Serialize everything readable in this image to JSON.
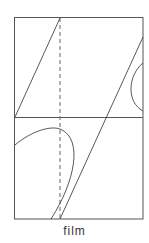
{
  "diagram": {
    "caption": "film",
    "colors": {
      "line": "#444444",
      "background": "#ffffff"
    },
    "frame": {
      "x": 14,
      "y": 17,
      "width": 129,
      "height": 202
    },
    "divider_y": 117,
    "dashed_x": 60
  }
}
